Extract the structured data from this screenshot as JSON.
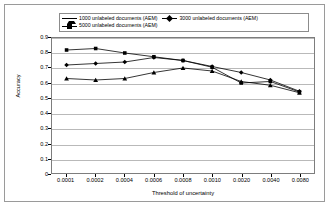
{
  "chart_data": {
    "type": "line",
    "title": "",
    "xlabel": "Threshold of uncertainty",
    "ylabel": "Accuracy",
    "categories": [
      "0.0001",
      "0.0002",
      "0.0004",
      "0.0006",
      "0.0008",
      "0.0010",
      "0.0020",
      "0.0040",
      "0.0080"
    ],
    "ylim": [
      0,
      0.9
    ],
    "yticks": [
      "0",
      "0.1",
      "0.2",
      "0.3",
      "0.4",
      "0.5",
      "0.6",
      "0.7",
      "0.8",
      "0.9"
    ],
    "grid": "horizontal",
    "legend_position": "top",
    "series": [
      {
        "name": "1000 unlabeled documents (AEM)",
        "marker": "triangle",
        "color": "#000000",
        "values": [
          0.63,
          0.62,
          0.63,
          0.67,
          0.7,
          0.68,
          0.61,
          0.585,
          0.535
        ]
      },
      {
        "name": "3000 unlabeled documents (AEM)",
        "marker": "diamond",
        "color": "#000000",
        "values": [
          0.72,
          0.73,
          0.74,
          0.77,
          0.75,
          0.71,
          0.67,
          0.62,
          0.545
        ]
      },
      {
        "name": "5000 unlabeled documents (AEM)",
        "marker": "square",
        "color": "#000000",
        "values": [
          0.82,
          0.83,
          0.8,
          0.775,
          0.75,
          0.705,
          0.6,
          0.61,
          0.54
        ]
      }
    ]
  }
}
